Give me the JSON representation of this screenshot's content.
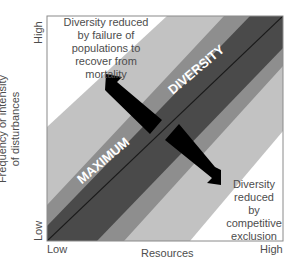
{
  "figure": {
    "type": "conceptual diagram",
    "colors": {
      "white_zone": "#ffffff",
      "light_band": "#c2c2c2",
      "medium_band": "#8e8e8e",
      "dark_band": "#4a4a4a",
      "arrow": "#000000",
      "center_line": "#1a1a1a",
      "band_text": "#ffffff"
    },
    "axes": {
      "x_label": "Resources",
      "x_low": "Low",
      "x_high": "High",
      "y_label_line1": "Frequency or intensity",
      "y_label_line2": "of disturbances",
      "y_low": "Low",
      "y_high": "High"
    },
    "band_text": {
      "left": "MAXIMUM",
      "right": "DIVERSITY"
    },
    "annotations": {
      "top_left": [
        "Diversity reduced",
        "by failure of",
        "populations to",
        "recover from",
        "mortality"
      ],
      "bottom_right": [
        "Diversity",
        "reduced",
        "by",
        "competitive",
        "exclusion"
      ]
    }
  }
}
